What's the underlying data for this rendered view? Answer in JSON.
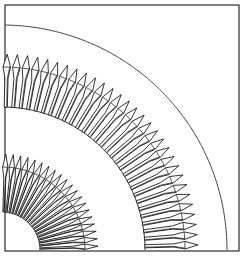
{
  "figure": {
    "type": "technical-line-drawing",
    "background_color": "#ffffff",
    "line_color": "#111111",
    "boundary_line_color": "#3a3a3a",
    "canvas": {
      "width": 246,
      "height": 256
    }
  },
  "frame": {
    "name": "outer rectangular border",
    "x": 5,
    "y": 5,
    "width": 234,
    "height": 246,
    "stroke_width": 1.1
  },
  "geometry": {
    "origin_x": 2,
    "origin_y": 250,
    "sweep_start_deg": 0,
    "sweep_end_deg": 90,
    "outer_boundary_radius": 225,
    "description": "All arcs and blades radiate from the lower-left origin through a 90 degree quarter sweep."
  },
  "rings": [
    {
      "id": "outer-ring",
      "label": "Outer blade ring",
      "hub_radius": 143,
      "stem_outer_radius": 172,
      "tip_radius": 196,
      "blade_count": 30,
      "blade_angular_pitch_deg": 3.0,
      "stem_half_width_deg": 0.62,
      "tip_half_width_deg": 1.18,
      "tip_shoulder_fraction": 0.46,
      "rib_inset_deg": 0.26
    },
    {
      "id": "inner-ring",
      "label": "Inner blade ring",
      "hub_radius": 38,
      "stem_outer_radius": 72,
      "tip_radius": 96,
      "blade_count": 20,
      "blade_angular_pitch_deg": 4.5,
      "stem_half_width_deg": 0.95,
      "tip_half_width_deg": 1.85,
      "tip_shoulder_fraction": 0.46,
      "rib_inset_deg": 0.4
    }
  ],
  "arcs": [
    {
      "id": "outer-boundary-arc",
      "label": "Outer casing boundary",
      "radius": 225,
      "stroke": "#3a3a3a",
      "stroke_width": 1.0
    },
    {
      "id": "outer-ring-hub-arc",
      "label": "Outer ring root circle",
      "radius": 143,
      "stroke": "#1a1a1a",
      "stroke_width": 1.0
    },
    {
      "id": "inner-ring-hub-arc",
      "label": "Inner ring root circle",
      "radius": 38,
      "stroke": "#1a1a1a",
      "stroke_width": 1.0
    }
  ]
}
